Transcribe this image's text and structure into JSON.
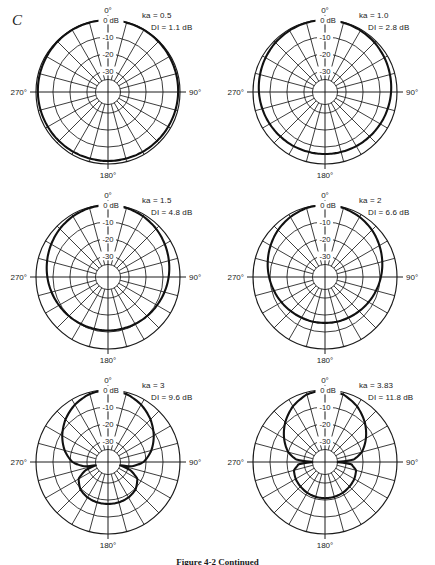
{
  "figure": {
    "panel_letter": "C",
    "caption": "Figure 4-2   Continued"
  },
  "axes": {
    "angle_labels": {
      "top": "0°",
      "right": "90°",
      "bottom": "180°",
      "left": "270°"
    },
    "radial_labels": [
      "0 dB",
      "-10",
      "-20",
      "-30"
    ],
    "radial_values_db": [
      0,
      -10,
      -20,
      -30
    ],
    "spoke_count": 24,
    "spoke_step_deg": 15,
    "ring_count": 4,
    "db_floor": -35,
    "grid_color": "#1a1a1a",
    "curve_color": "#111111"
  },
  "chart_data": {
    "type": "line",
    "subtype": "polar-directivity",
    "title": "",
    "xlabel": "Angle (degrees)",
    "ylabel": "Relative level (dB)",
    "rlim": [
      -35,
      0
    ],
    "rticks": [
      0,
      -10,
      -20,
      -30
    ],
    "rtick_labels": [
      "0 dB",
      "-10",
      "-20",
      "-30"
    ],
    "thetaticks": [
      0,
      90,
      180,
      270
    ],
    "thetatick_labels": [
      "0°",
      "90°",
      "180°",
      "270°"
    ],
    "theta_direction": "clockwise",
    "theta_zero_location": "N",
    "grid": true,
    "legend": "none",
    "model": "piston_in_sphere_2J1(ka sin t)/(ka sin t) style lobe",
    "panels": [
      {
        "index": 0,
        "ka_label": "ka = 0.5",
        "di_label": "DI = 1.1 dB",
        "ka": 0.5,
        "di_db": 1.1,
        "angles_deg": [
          0,
          15,
          30,
          45,
          60,
          75,
          90,
          105,
          120,
          135,
          150,
          165,
          180
        ],
        "values_db": [
          0.0,
          -0.1,
          -0.2,
          -0.4,
          -0.7,
          -0.9,
          -1.1,
          -1.3,
          -1.5,
          -1.6,
          -1.7,
          -1.8,
          -1.8
        ]
      },
      {
        "index": 1,
        "ka_label": "ka = 1.0",
        "di_label": "DI = 2.8 dB",
        "ka": 1.0,
        "di_db": 2.8,
        "angles_deg": [
          0,
          15,
          30,
          45,
          60,
          75,
          90,
          105,
          120,
          135,
          150,
          165,
          180
        ],
        "values_db": [
          0.0,
          -0.2,
          -0.6,
          -1.2,
          -2.0,
          -2.8,
          -3.5,
          -4.2,
          -4.8,
          -5.3,
          -5.6,
          -5.8,
          -5.9
        ]
      },
      {
        "index": 2,
        "ka_label": "ka = 1.5",
        "di_label": "DI = 4.8 dB",
        "ka": 1.5,
        "di_db": 4.8,
        "angles_deg": [
          0,
          15,
          30,
          45,
          60,
          75,
          90,
          105,
          120,
          135,
          150,
          165,
          180
        ],
        "values_db": [
          0.0,
          -0.3,
          -1.1,
          -2.3,
          -3.8,
          -5.3,
          -6.7,
          -8.0,
          -9.1,
          -9.9,
          -10.5,
          -10.8,
          -10.9
        ]
      },
      {
        "index": 3,
        "ka_label": "ka = 2",
        "di_label": "DI = 6.6 dB",
        "ka": 2.0,
        "di_db": 6.6,
        "angles_deg": [
          0,
          15,
          30,
          45,
          60,
          75,
          90,
          105,
          120,
          135,
          150,
          165,
          180
        ],
        "values_db": [
          0.0,
          -0.4,
          -1.6,
          -3.3,
          -5.4,
          -7.5,
          -9.5,
          -11.3,
          -12.8,
          -14.0,
          -14.8,
          -15.2,
          -15.4
        ]
      },
      {
        "index": 4,
        "ka_label": "ka = 3",
        "di_label": "DI = 9.6 dB",
        "ka": 3.0,
        "di_db": 9.6,
        "angles_deg": [
          0,
          15,
          30,
          45,
          60,
          75,
          90,
          100,
          105,
          110,
          120,
          135,
          150,
          165,
          180
        ],
        "values_db": [
          0.0,
          -0.9,
          -3.4,
          -7.0,
          -11.3,
          -16.0,
          -21.5,
          -28.0,
          -35.0,
          -28.5,
          -22.5,
          -19.5,
          -18.3,
          -17.8,
          -17.7
        ]
      },
      {
        "index": 5,
        "ka_label": "ka = 3.83",
        "di_label": "DI = 11.8 dB",
        "ka": 3.83,
        "di_db": 11.8,
        "angles_deg": [
          0,
          15,
          30,
          45,
          60,
          75,
          85,
          90,
          95,
          105,
          120,
          135,
          150,
          165,
          180
        ],
        "values_db": [
          0.0,
          -1.2,
          -4.6,
          -9.3,
          -14.6,
          -20.0,
          -25.5,
          -35.0,
          -27.0,
          -23.5,
          -22.5,
          -22.0,
          -21.5,
          -21.2,
          -21.1
        ]
      }
    ]
  }
}
